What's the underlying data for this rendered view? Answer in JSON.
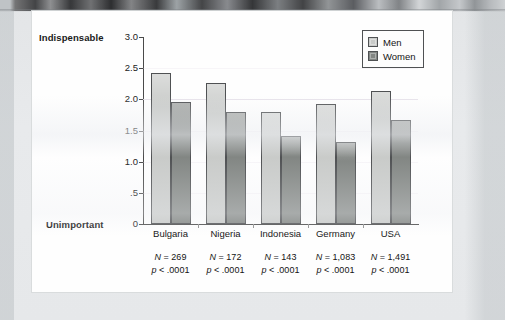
{
  "chart_data": {
    "type": "bar",
    "title": "",
    "subtitle": "",
    "xlabel": "",
    "ylabel": "",
    "ylim": [
      0,
      3.0
    ],
    "grid": true,
    "legend_position": "top-right",
    "categories": [
      "Bulgaria",
      "Nigeria",
      "Indonesia",
      "Germany",
      "USA"
    ],
    "series": [
      {
        "name": "Men",
        "color": "#c9cbc9",
        "values": [
          2.42,
          2.27,
          1.79,
          1.93,
          2.13
        ]
      },
      {
        "name": "Women",
        "color": "#828683",
        "values": [
          1.96,
          1.79,
          1.41,
          1.31,
          1.67
        ]
      }
    ],
    "ytick_labels": [
      "3.0",
      "2.5",
      "2.0",
      "1.5",
      "1.0",
      ".5",
      "0"
    ],
    "ytick_values": [
      3.0,
      2.5,
      2.0,
      1.5,
      1.0,
      0.5,
      0
    ],
    "axis_endpoint_labels": {
      "top": "Indispensable",
      "bottom": "Unimportant"
    },
    "annotations": [
      {
        "category": "Bulgaria",
        "n_label": "N",
        "n_value": "= 269",
        "p_label": "p",
        "p_value": "< .0001"
      },
      {
        "category": "Nigeria",
        "n_label": "N",
        "n_value": "= 172",
        "p_label": "p",
        "p_value": "< .0001"
      },
      {
        "category": "Indonesia",
        "n_label": "N",
        "n_value": "= 143",
        "p_label": "p",
        "p_value": "< .0001"
      },
      {
        "category": "Germany",
        "n_label": "N",
        "n_value": "= 1,083",
        "p_label": "p",
        "p_value": "< .0001"
      },
      {
        "category": "USA",
        "n_label": "N",
        "n_value": "= 1,491",
        "p_label": "p",
        "p_value": "< .0001"
      }
    ]
  },
  "colors": {
    "men_bar": "#c9cbc9",
    "women_bar": "#828683",
    "bar_outline": "#4f5153",
    "axis": "#4a4a4a",
    "gridline": "#e4dee8",
    "page": "#fefefe",
    "surround": "#e6e8ea",
    "text": "#141414"
  }
}
